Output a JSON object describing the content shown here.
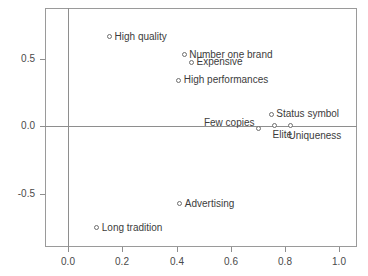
{
  "chart_data": {
    "type": "scatter",
    "title": "",
    "xlabel": "",
    "ylabel": "",
    "xlim": [
      -0.085,
      1.065
    ],
    "ylim": [
      -0.895,
      0.875
    ],
    "grid": false,
    "legend": "none",
    "reference_lines": {
      "vertical_x": 0.0,
      "horizontal_y": 0.0
    },
    "xticks": [
      "0.0",
      "0.2",
      "0.4",
      "0.6",
      "0.8",
      "1.0"
    ],
    "xtick_values": [
      0.0,
      0.2,
      0.4,
      0.6,
      0.8,
      1.0
    ],
    "yticks": [
      "0.5",
      "0.0",
      "-0.5"
    ],
    "ytick_values": [
      0.5,
      0.0,
      -0.5
    ],
    "points": [
      {
        "label": "High quality",
        "x": 0.153,
        "y": 0.662,
        "label_pos": "right"
      },
      {
        "label": "Number one brand",
        "x": 0.428,
        "y": 0.528,
        "label_pos": "right"
      },
      {
        "label": "Expensive",
        "x": 0.455,
        "y": 0.475,
        "label_pos": "right"
      },
      {
        "label": "High performances",
        "x": 0.408,
        "y": 0.34,
        "label_pos": "right"
      },
      {
        "label": "Status symbol",
        "x": 0.749,
        "y": 0.088,
        "label_pos": "right"
      },
      {
        "label": "Few copies",
        "x": 0.702,
        "y": -0.015,
        "label_pos": "left"
      },
      {
        "label": "Elite",
        "x": 0.761,
        "y": 0.006,
        "label_pos": "below"
      },
      {
        "label": "Uniqueness",
        "x": 0.82,
        "y": 0.004,
        "label_pos": "below"
      },
      {
        "label": "Advertising",
        "x": 0.412,
        "y": -0.575,
        "label_pos": "right"
      },
      {
        "label": "Long tradition",
        "x": 0.106,
        "y": -0.753,
        "label_pos": "right"
      }
    ]
  },
  "colors": {
    "frame": "#9a9a9a",
    "reference_line": "#8e8e8e",
    "marker_stroke": "#6e6e6e",
    "text": "#3c3c3c",
    "background": "#ffffff"
  }
}
